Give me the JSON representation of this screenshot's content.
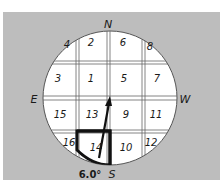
{
  "diagram": {
    "type": "stereonet-grid",
    "compass": {
      "north": "N",
      "south": "S",
      "east": "E",
      "west": "W"
    },
    "cells": [
      {
        "label": "4",
        "x": 67,
        "y": 48
      },
      {
        "label": "2",
        "x": 91,
        "y": 46
      },
      {
        "label": "6",
        "x": 123,
        "y": 46
      },
      {
        "label": "8",
        "x": 150,
        "y": 50
      },
      {
        "label": "3",
        "x": 58,
        "y": 82
      },
      {
        "label": "1",
        "x": 91,
        "y": 82
      },
      {
        "label": "5",
        "x": 124,
        "y": 82
      },
      {
        "label": "7",
        "x": 157,
        "y": 82
      },
      {
        "label": "15",
        "x": 60,
        "y": 118
      },
      {
        "label": "13",
        "x": 92,
        "y": 118
      },
      {
        "label": "9",
        "x": 126,
        "y": 118
      },
      {
        "label": "11",
        "x": 156,
        "y": 118
      },
      {
        "label": "16",
        "x": 69,
        "y": 146
      },
      {
        "label": "14",
        "x": 96,
        "y": 151
      },
      {
        "label": "10",
        "x": 126,
        "y": 151
      },
      {
        "label": "12",
        "x": 151,
        "y": 146
      }
    ],
    "highlighted_cell": "14",
    "angle_label": "6.0°",
    "colors": {
      "background": "#bdbdbd",
      "circle": "#ffffff",
      "ink": "#1a1a1a"
    }
  }
}
